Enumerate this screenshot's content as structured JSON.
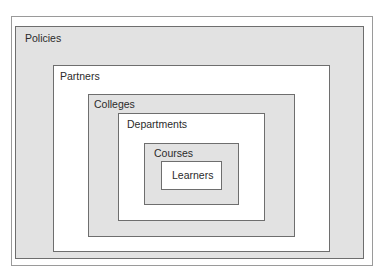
{
  "diagram": {
    "type": "nested-boxes",
    "levels": [
      {
        "name": "Policies"
      },
      {
        "name": "Partners"
      },
      {
        "name": "Colleges"
      },
      {
        "name": "Departments"
      },
      {
        "name": "Courses"
      },
      {
        "name": "Learners"
      }
    ]
  },
  "colors": {
    "gray_fill": "#e2e2e2",
    "white_fill": "#ffffff",
    "border": "#6e6e6e"
  }
}
